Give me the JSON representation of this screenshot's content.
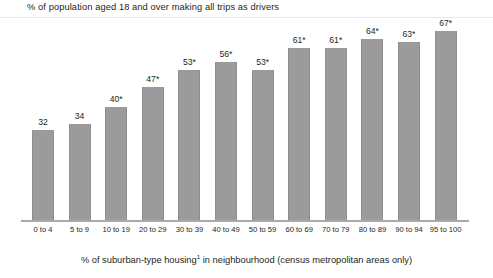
{
  "chart_data": {
    "type": "bar",
    "title": "% of population aged 18 and over making all trips as drivers",
    "xlabel_prefix": "% of suburban-type housing",
    "xlabel_superscript": "1",
    "xlabel_suffix": " in neighbourhood (census metropolitan areas only)",
    "ylabel": "",
    "ylim": [
      0,
      70
    ],
    "grid": false,
    "legend": "none",
    "bar_color": "#9b9b9b",
    "axis_color": "#a9a9a7",
    "categories": [
      "0 to 4",
      "5 to 9",
      "10 to 19",
      "20 to 29",
      "30 to 39",
      "40 to 49",
      "50 to 59",
      "60 to 69",
      "70 to 79",
      "80 to 89",
      "90 to 94",
      "95 to 100"
    ],
    "values": [
      32,
      34,
      40,
      47,
      53,
      56,
      53,
      61,
      61,
      64,
      63,
      67
    ],
    "value_labels": [
      "32",
      "34",
      "40*",
      "47*",
      "53*",
      "56*",
      "53*",
      "61*",
      "61*",
      "64*",
      "63*",
      "67*"
    ]
  }
}
